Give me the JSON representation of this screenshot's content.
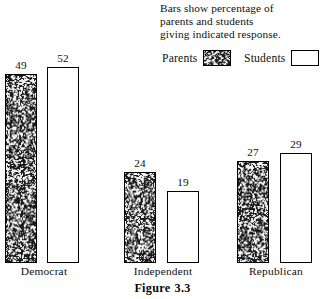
{
  "note": {
    "lines": [
      "Bars show percentage of",
      "parents and students",
      "giving indicated response."
    ]
  },
  "legend": {
    "entries": [
      {
        "label": "Parents",
        "swatch": "stippled-dark-swatch",
        "color": "#6e6e6e"
      },
      {
        "label": "Students",
        "swatch": "white-swatch",
        "color": "#ffffff"
      }
    ]
  },
  "figure": {
    "caption_word": "Figure",
    "caption_number": "3.3"
  },
  "chart_data": {
    "type": "bar",
    "subtitle": "Bars show percentage of parents and students giving indicated response.",
    "xlabel": "",
    "ylabel": "",
    "ylim": [
      0,
      60
    ],
    "grid": false,
    "legend_position": "top-right",
    "categories": [
      "Democrat",
      "Independent",
      "Republican"
    ],
    "series": [
      {
        "name": "Parents",
        "values": [
          49,
          52,
          0
        ],
        "color": "#6e6e6e"
      },
      {
        "name": "Students",
        "values": [
          0,
          0,
          0
        ],
        "color": "#ffffff"
      }
    ],
    "groups": [
      {
        "category": "Democrat",
        "bars": [
          {
            "series": "Parents",
            "value": 49,
            "label": "49"
          },
          {
            "series": "Students",
            "value": 52,
            "label": "52"
          }
        ]
      },
      {
        "category": "Independent",
        "bars": [
          {
            "series": "Parents",
            "value": 24,
            "label": "24"
          },
          {
            "series": "Students",
            "value": 19,
            "label": "19"
          }
        ]
      },
      {
        "category": "Republican",
        "bars": [
          {
            "series": "Parents",
            "value": 27,
            "label": "27"
          },
          {
            "series": "Students",
            "value": 29,
            "label": "29"
          }
        ]
      }
    ]
  },
  "layout": {
    "baseline_y": 263,
    "px_per_unit": 3.77,
    "bar_width": 32,
    "groups_x": [
      {
        "parents_x": 5,
        "students_x": 47,
        "label_center": 44
      },
      {
        "parents_x": 124,
        "students_x": 167,
        "label_center": 163
      },
      {
        "parents_x": 237,
        "students_x": 280,
        "label_center": 276
      }
    ]
  }
}
